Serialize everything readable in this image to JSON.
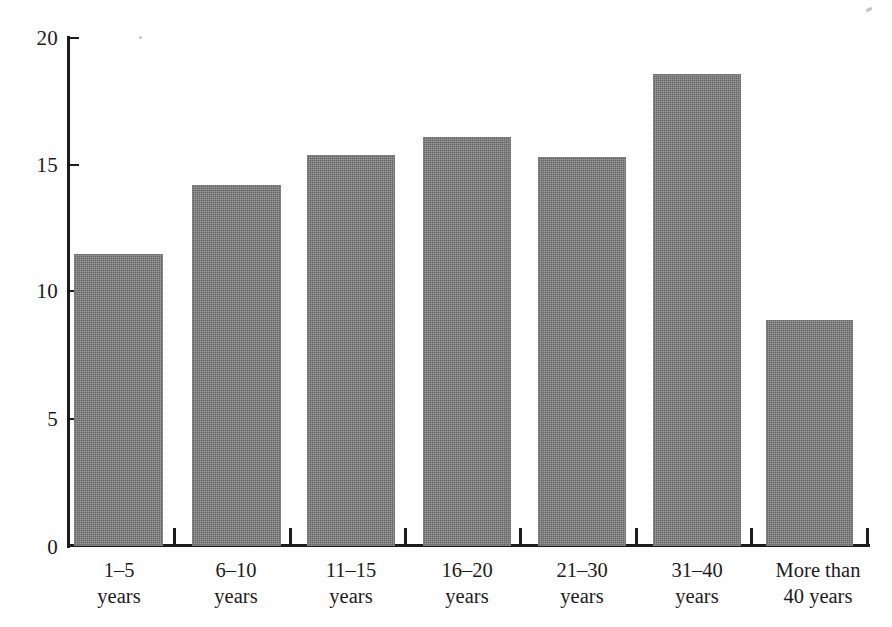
{
  "chart_data": {
    "type": "bar",
    "title": "",
    "subtitle": "",
    "xlabel": "",
    "ylabel": "",
    "categories": [
      "1–5 years",
      "6–10 years",
      "11–15 years",
      "16–20 years",
      "21–30 years",
      "31–40 years",
      "More than 40 years"
    ],
    "category_lines": [
      {
        "line1": "1–5",
        "line2": "years"
      },
      {
        "line1": "6–10",
        "line2": "years"
      },
      {
        "line1": "11–15",
        "line2": "years"
      },
      {
        "line1": "16–20",
        "line2": "years"
      },
      {
        "line1": "21–30",
        "line2": "years"
      },
      {
        "line1": "31–40",
        "line2": "years"
      },
      {
        "line1": "More than",
        "line2": "40 years"
      }
    ],
    "values": [
      11.5,
      14.2,
      15.4,
      16.1,
      15.3,
      18.6,
      8.9
    ],
    "ylim": [
      0,
      20
    ],
    "yticks": [
      0,
      5,
      10,
      15,
      20
    ],
    "ytick_labels": [
      "0",
      "5",
      "10",
      "15",
      "20"
    ],
    "grid": false,
    "legend": null,
    "bar_color": "#7f7f7f",
    "axis_color": "#1c1c1c",
    "background_color": "#ffffff"
  }
}
